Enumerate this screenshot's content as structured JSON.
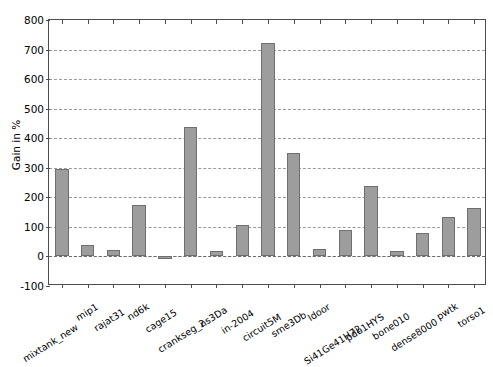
{
  "chart_data": {
    "type": "bar",
    "title": "",
    "xlabel": "",
    "ylabel": "Gain in %",
    "ylim": [
      -100,
      800
    ],
    "yticks": [
      -100,
      0,
      100,
      200,
      300,
      400,
      500,
      600,
      700,
      800
    ],
    "ytick_labels": [
      "-100",
      "0",
      "100",
      "200",
      "300",
      "400",
      "500",
      "600",
      "700",
      "800"
    ],
    "grid": true,
    "legend": "none",
    "bar_color": "#9d9d9d",
    "bar_edge_color": "#6f6f6f",
    "categories": [
      "mixtank_new",
      "mip1",
      "rajat31",
      "nd6k",
      "cage15",
      "crankseg_2",
      "ns3Da",
      "in-2004",
      "circuit5M",
      "sme3Db",
      "ldoor",
      "Si41Ge41H72",
      "pdb1HYS",
      "bone010",
      "dense8000",
      "pwtk",
      "torso1"
    ],
    "values": [
      297,
      38,
      22,
      175,
      -8,
      437,
      18,
      107,
      722,
      350,
      25,
      90,
      240,
      18,
      80,
      133,
      163
    ]
  }
}
